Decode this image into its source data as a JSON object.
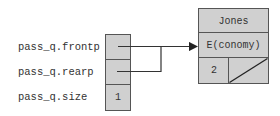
{
  "diagram": {
    "struct_fields": [
      {
        "label": "pass_q.frontp",
        "value": ""
      },
      {
        "label": "pass_q.rearp",
        "value": ""
      },
      {
        "label": "pass_q.size",
        "value": "1"
      }
    ],
    "node": {
      "name": "Jones",
      "class": "E(conomy)",
      "count": "2",
      "next": "null"
    },
    "colors": {
      "cell_fill": "#d0d0d0",
      "border": "#555555",
      "line": "#333333"
    }
  }
}
